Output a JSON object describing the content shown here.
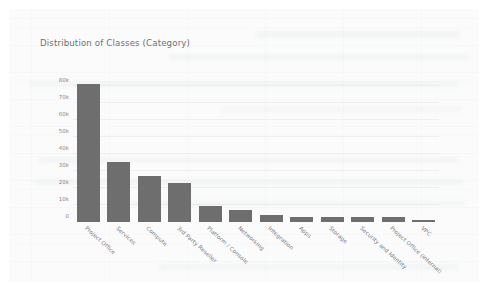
{
  "card": {
    "background_color": "#fbfbfb",
    "page_background_color": "#ffffff"
  },
  "chart_data": {
    "type": "bar",
    "title": "Distribution of Classes (Category)",
    "xlabel": "",
    "ylabel": "",
    "ylim": [
      0,
      85000
    ],
    "grid": true,
    "legend": "none",
    "bar_color": "#6e6e6e",
    "tick_labels": [
      "0",
      "10k",
      "20k",
      "30k",
      "40k",
      "50k",
      "60k",
      "70k",
      "80k"
    ],
    "tick_values": [
      0,
      10000,
      20000,
      30000,
      40000,
      50000,
      60000,
      70000,
      80000
    ],
    "categories": [
      "Project Office",
      "Services",
      "Compute",
      "3rd Party Reseller",
      "Platform / Console",
      "Networking",
      "Integration",
      "Apps",
      "Storage",
      "Security and Identity",
      "Project Office (internal)",
      "VPC"
    ],
    "values": [
      81000,
      35000,
      27000,
      23000,
      9500,
      7000,
      4000,
      3000,
      3200,
      3000,
      2800,
      1000
    ]
  }
}
